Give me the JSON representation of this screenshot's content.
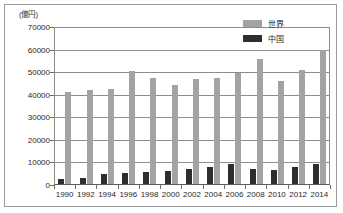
{
  "figure": {
    "unit_label": "(億円)",
    "frame_color": "#9a9a9a",
    "background": "#ffffff"
  },
  "legend": {
    "position": "top-right",
    "items": [
      {
        "label": "世界",
        "color": "#a3a3a3",
        "swatch_name": "legend-swatch-world"
      },
      {
        "label": "中国",
        "color": "#2e2e2e",
        "swatch_name": "legend-swatch-china"
      }
    ]
  },
  "axes": {
    "y_ticks": [
      "0",
      "10000",
      "20000",
      "30000",
      "40000",
      "50000",
      "60000",
      "70000"
    ],
    "x_ticks": [
      "1990",
      "1992",
      "1994",
      "1996",
      "1998",
      "2000",
      "2002",
      "2004",
      "2006",
      "2008",
      "2010",
      "2012",
      "2014"
    ]
  },
  "chart_data": {
    "type": "bar",
    "title": "",
    "subtitle": "",
    "xlabel": "",
    "ylabel": "(億円)",
    "ylim": [
      0,
      70000
    ],
    "ytick_step": 10000,
    "grid": true,
    "legend_position": "top-right",
    "categories": [
      "1990",
      "1992",
      "1994",
      "1996",
      "1998",
      "2000",
      "2002",
      "2004",
      "2006",
      "2008",
      "2010",
      "2012",
      "2014"
    ],
    "series": [
      {
        "name": "世界",
        "color": "#a3a3a3",
        "values": [
          41000,
          42300,
          42700,
          50500,
          47500,
          44500,
          47000,
          47600,
          49500,
          55700,
          46300,
          51000,
          59800
        ]
      },
      {
        "name": "中国",
        "color": "#2e2e2e",
        "values": [
          2500,
          3200,
          4700,
          5300,
          5800,
          6300,
          7000,
          7900,
          9200,
          7000,
          6700,
          7800,
          9100
        ]
      }
    ]
  }
}
